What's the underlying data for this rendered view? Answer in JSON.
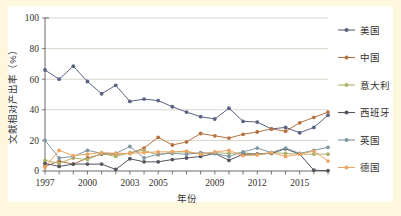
{
  "figure": {
    "background_color": "#fdf7de",
    "panel_color": "#ffffff"
  },
  "axis": {
    "y_title": "文献相对产出率（%）",
    "x_title": "年份",
    "y_ticks": [
      "0",
      "20",
      "40",
      "60",
      "80",
      "100"
    ],
    "x_ticks_shown": [
      "1997",
      "2000",
      "2003",
      "2005",
      "2009",
      "2012",
      "2015"
    ]
  },
  "legend": {
    "position": "right",
    "items": [
      {
        "label": "美国",
        "color": "#5b6382"
      },
      {
        "label": "中国",
        "color": "#b5713f"
      },
      {
        "label": "意大利",
        "color": "#b0b06a"
      },
      {
        "label": "西班牙",
        "color": "#55555f"
      },
      {
        "label": "英国",
        "color": "#7f97a3"
      },
      {
        "label": "德国",
        "color": "#eda562"
      }
    ]
  },
  "chart_data": {
    "type": "line",
    "title": "",
    "xlabel": "年份",
    "ylabel": "文献相对产出率（%）",
    "xlim": [
      1997,
      2017
    ],
    "ylim": [
      0,
      100
    ],
    "yticks": [
      0,
      20,
      40,
      60,
      80,
      100
    ],
    "xtick_labels": [
      "1997",
      "2000",
      "2003",
      "2005",
      "2009",
      "2012",
      "2015"
    ],
    "xtick_values": [
      1997,
      2000,
      2003,
      2005,
      2009,
      2012,
      2015
    ],
    "grid": "horizontal",
    "legend_position": "right",
    "x": [
      1997,
      1998,
      1999,
      2000,
      2001,
      2002,
      2003,
      2004,
      2005,
      2006,
      2007,
      2008,
      2009,
      2010,
      2011,
      2012,
      2013,
      2014,
      2015,
      2016,
      2017
    ],
    "series": [
      {
        "name": "美国",
        "color": "#5b6382",
        "values": [
          66.0,
          60.0,
          68.5,
          58.5,
          50.5,
          56.0,
          45.5,
          47.0,
          46.0,
          42.0,
          38.5,
          35.5,
          34.0,
          41.0,
          32.5,
          32.0,
          27.5,
          28.5,
          25.0,
          28.5,
          36.5
        ]
      },
      {
        "name": "中国",
        "color": "#b5713f",
        "values": [
          3.0,
          6.5,
          4.5,
          8.5,
          11.0,
          11.0,
          11.5,
          15.0,
          22.0,
          17.0,
          19.0,
          24.5,
          23.0,
          21.5,
          24.0,
          25.5,
          27.5,
          26.0,
          31.5,
          35.0,
          38.5
        ]
      },
      {
        "name": "意大利",
        "color": "#b0b06a",
        "values": [
          7.0,
          5.0,
          8.5,
          7.5,
          11.5,
          9.5,
          12.0,
          13.5,
          10.5,
          12.5,
          12.5,
          11.0,
          12.0,
          11.5,
          12.0,
          11.0,
          12.0,
          11.5,
          11.0,
          11.0,
          11.0
        ]
      },
      {
        "name": "西班牙",
        "color": "#55555f",
        "values": [
          5.0,
          3.0,
          4.5,
          4.5,
          4.5,
          1.0,
          8.0,
          6.0,
          6.0,
          7.5,
          8.5,
          9.5,
          11.5,
          7.0,
          11.0,
          11.0,
          11.5,
          14.5,
          11.0,
          0.5,
          0.2
        ]
      },
      {
        "name": "英国",
        "color": "#7f97a3",
        "values": [
          20.0,
          8.5,
          9.5,
          13.5,
          11.5,
          11.5,
          16.0,
          8.5,
          11.0,
          11.5,
          11.0,
          12.0,
          11.5,
          9.5,
          12.5,
          15.0,
          12.0,
          15.0,
          11.5,
          13.5,
          15.5
        ]
      },
      {
        "name": "德国",
        "color": "#eda562",
        "values": [
          2.5,
          13.5,
          10.0,
          11.0,
          12.0,
          11.5,
          11.5,
          12.0,
          12.5,
          12.5,
          13.0,
          11.0,
          12.5,
          13.5,
          10.0,
          10.5,
          12.0,
          9.5,
          11.0,
          13.0,
          6.5
        ]
      }
    ]
  }
}
